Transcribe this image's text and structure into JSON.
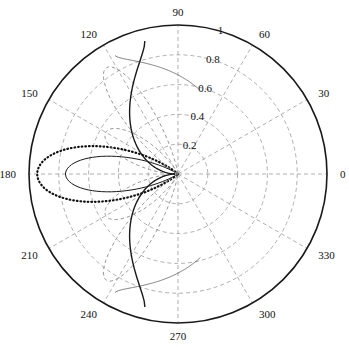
{
  "figure": {
    "kind": "polar-plot",
    "background_color": "#ffffff",
    "width": 349,
    "height": 347
  },
  "chart_data": {
    "type": "line",
    "subtype": "polar",
    "title": "",
    "xlabel": "",
    "ylabel": "",
    "grid": true,
    "legend": null,
    "center": {
      "x": 178,
      "y": 174
    },
    "outer_radius_px": 149,
    "angle_unit": "degrees",
    "angle_direction": "counterclockwise",
    "angle_zero_at": "east",
    "radial_axis": {
      "min": 0,
      "max": 1,
      "ticks": [
        0.2,
        0.4,
        0.6,
        0.8,
        1
      ],
      "tick_labels": [
        "0.2",
        "0.4",
        "0.6",
        "0.8",
        "1"
      ],
      "label_angle_deg": 75
    },
    "angular_axis": {
      "ticks": [
        0,
        30,
        60,
        90,
        120,
        150,
        180,
        210,
        240,
        270,
        300,
        330
      ],
      "tick_labels": [
        "0",
        "30",
        "60",
        "90",
        "120",
        "150",
        "180",
        "210",
        "240",
        "270",
        "300",
        "330"
      ]
    },
    "grid_style": {
      "circle_color": "#9a9a9a",
      "circle_dash": "4,3",
      "spoke_color": "#9a9a9a",
      "spoke_dash": "4,3",
      "outer_circle_color": "#1a1a1a",
      "outer_circle_width": 1.6
    },
    "series": [
      {
        "name": "pattern-solid-main-lobe",
        "style": "solid",
        "color": "#1a1a1a",
        "width": 1.0,
        "peak_radius": 0.755,
        "peak_angle_deg": 180,
        "beamwidth_deg": 70,
        "description": "Thin solid broadside lobe peaking at 180 deg with r = 0.755"
      },
      {
        "name": "pattern-dotted-wide-lobe",
        "style": "dotted",
        "color": "#111111",
        "width": 2.2,
        "peak_radius": 0.945,
        "peak_angle_deg": 180,
        "beamwidth_deg": 88,
        "description": "Heavy dotted broadside lobe peaking at 180 deg with r = 0.945"
      },
      {
        "name": "pattern-dashed-upper-lobe",
        "style": "dashed",
        "color": "#8c8c8c",
        "width": 0.9,
        "peak_radius": 0.86,
        "peak_angle_deg": 124,
        "beamwidth_deg": 52,
        "description": "Light dashed lobe peaking near 124 deg"
      },
      {
        "name": "pattern-dashed-lower-lobe",
        "style": "dashed",
        "color": "#8c8c8c",
        "width": 0.9,
        "peak_radius": 0.86,
        "peak_angle_deg": 236,
        "beamwidth_deg": 52,
        "description": "Light dashed lobe peaking near 236 deg, mirror of upper"
      },
      {
        "name": "pattern-dashed-inner-upper",
        "style": "dashed",
        "color": "#8c8c8c",
        "width": 0.9,
        "peak_radius": 0.56,
        "peak_angle_deg": 150,
        "beamwidth_deg": 70,
        "description": "Light dashed inner lobe toward 150 deg"
      },
      {
        "name": "pattern-dashed-inner-lower",
        "style": "dashed",
        "color": "#8c8c8c",
        "width": 0.9,
        "peak_radius": 0.56,
        "peak_angle_deg": 210,
        "beamwidth_deg": 70,
        "description": "Light dashed inner lobe toward 210 deg"
      },
      {
        "name": "pattern-dark-curve-upper",
        "style": "solid",
        "color": "#1a1a1a",
        "width": 1.4,
        "start_angle_deg": 104,
        "end_angle_deg": 180,
        "start_radius": 0.92,
        "end_radius": 0.02,
        "description": "Heavy solid arc sweeping from 104 deg near the rim down into the origin"
      },
      {
        "name": "pattern-dark-curve-lower",
        "style": "solid",
        "color": "#1a1a1a",
        "width": 1.4,
        "start_angle_deg": 256,
        "end_angle_deg": 180,
        "start_radius": 0.92,
        "end_radius": 0.02,
        "description": "Heavy solid arc sweeping from 256 deg near the rim down into the origin"
      },
      {
        "name": "pattern-thin-curve-upper",
        "style": "solid",
        "color": "#4a4a4a",
        "width": 0.7,
        "start_angle_deg": 118,
        "end_angle_deg": 75,
        "start_radius": 0.9,
        "end_radius": 0.58,
        "description": "Faint thin stroke crossing the upper left quadrant"
      },
      {
        "name": "pattern-thin-curve-lower",
        "style": "solid",
        "color": "#4a4a4a",
        "width": 0.7,
        "start_angle_deg": 242,
        "end_angle_deg": 285,
        "start_radius": 0.9,
        "end_radius": 0.58,
        "description": "Faint thin stroke crossing the lower left quadrant"
      }
    ]
  }
}
